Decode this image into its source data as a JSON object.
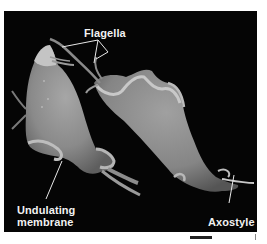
{
  "figure": {
    "background_color": "#050505",
    "labels": {
      "flagella": "Flagella",
      "undulating_membrane_line1": "Undulating",
      "undulating_membrane_line2": "membrane",
      "axostyle": "Axostyle"
    }
  }
}
